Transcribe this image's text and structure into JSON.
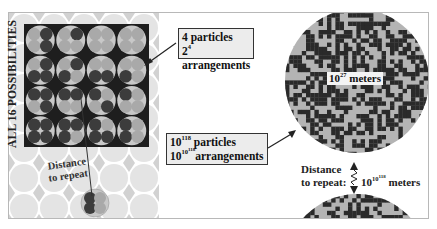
{
  "figure": {
    "vertical_title": "ALL 16 POSSIBILITIES",
    "small_system": {
      "callout_line1_text": "4 particles",
      "callout_line2_base": "2",
      "callout_line2_exp": "4",
      "callout_line2_text": " arrangements",
      "grid_rows": 4,
      "grid_cols": 4,
      "arrangements": [
        [
          0,
          1,
          0,
          1
        ],
        [
          0,
          1,
          0,
          0
        ],
        [
          0,
          0,
          0,
          0
        ],
        [
          0,
          0,
          0,
          0
        ],
        [
          0,
          1,
          1,
          1
        ],
        [
          0,
          1,
          1,
          0
        ],
        [
          0,
          0,
          1,
          1
        ],
        [
          0,
          0,
          1,
          0
        ],
        [
          1,
          1,
          0,
          1
        ],
        [
          1,
          1,
          0,
          0
        ],
        [
          1,
          0,
          0,
          1
        ],
        [
          1,
          0,
          0,
          0
        ],
        [
          1,
          1,
          1,
          1
        ],
        [
          1,
          1,
          1,
          0
        ],
        [
          1,
          0,
          1,
          1
        ],
        [
          1,
          0,
          1,
          0
        ]
      ],
      "distance_label_line1": "Distance",
      "distance_label_line2": "to repeat"
    },
    "large_system": {
      "callout_line1_base": "10",
      "callout_line1_exp": "118",
      "callout_line1_text": " particles",
      "callout_line2_base": "10",
      "callout_line2_exp_base": "10",
      "callout_line2_exp_exp": "118",
      "callout_line2_text": "arrangements",
      "sphere_label_base": "10",
      "sphere_label_exp": "27",
      "sphere_label_unit": " meters",
      "distance_label_line1": "Distance",
      "distance_label_line2": "to repeat:",
      "distance_value_base": "10",
      "distance_value_exp_base": "10",
      "distance_value_exp_exp": "118",
      "distance_value_unit": " meters"
    },
    "colors": {
      "dark_particle": "#3c3c3c",
      "light_particle": "#a9a9a9",
      "cell_background": "#c8c8c8",
      "grid_backdrop": "#1e1e1e",
      "pattern_light": "#b4b4b4",
      "pattern_dark": "#2a2a2a",
      "bg_circle": "#e4e4e4",
      "bg_diamond": "#d2d2d2",
      "callout_fill": "#ececec"
    }
  }
}
